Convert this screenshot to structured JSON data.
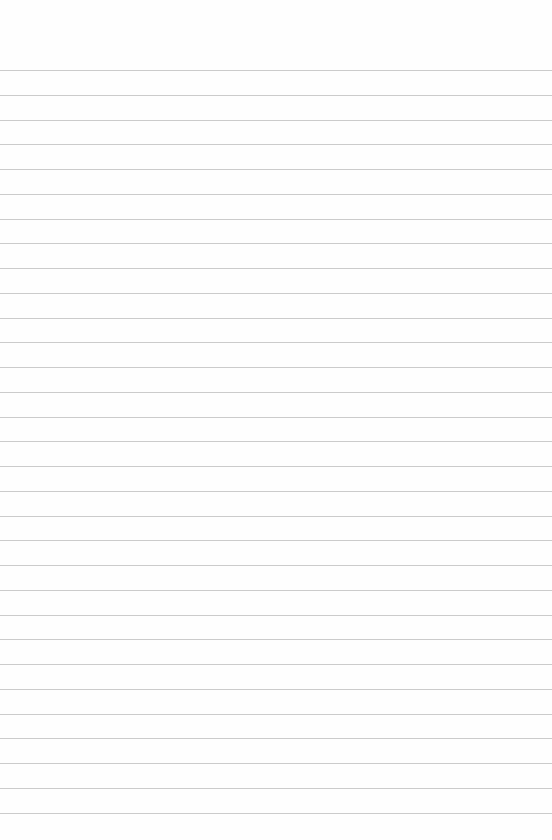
{
  "page": {
    "type": "lined-paper",
    "background_color": "#fefefe",
    "rule_color": "#b9b9b9",
    "first_rule_y": 70,
    "rule_spacing": 24.75,
    "rule_count": 31,
    "text_content": []
  }
}
